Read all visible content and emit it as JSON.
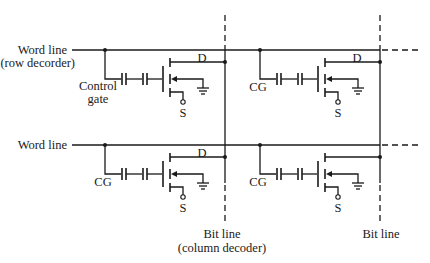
{
  "diagram": {
    "type": "flash-memory-cell-array-schematic",
    "word_lines": [
      {
        "label_line1": "Word line",
        "label_line2": "(row decorder)"
      },
      {
        "label_line1": "Word line",
        "label_line2": ""
      }
    ],
    "bit_lines": [
      {
        "label_line1": "Bit line",
        "label_line2": "(column decoder)"
      },
      {
        "label_line1": "Bit line",
        "label_line2": ""
      }
    ],
    "cells": [
      {
        "row": 1,
        "col": 1,
        "gate_label_line1": "Control",
        "gate_label_line2": "gate",
        "drain_label": "D",
        "source_label": "S"
      },
      {
        "row": 1,
        "col": 2,
        "gate_label_line1": "CG",
        "gate_label_line2": "",
        "drain_label": "D",
        "source_label": "S"
      },
      {
        "row": 2,
        "col": 1,
        "gate_label_line1": "CG",
        "gate_label_line2": "",
        "drain_label": "D",
        "source_label": "S"
      },
      {
        "row": 2,
        "col": 2,
        "gate_label_line1": "CG",
        "gate_label_line2": "",
        "drain_label": "",
        "source_label": "S"
      }
    ],
    "colors": {
      "line": "#1a1a1a",
      "background": "#ffffff"
    }
  }
}
